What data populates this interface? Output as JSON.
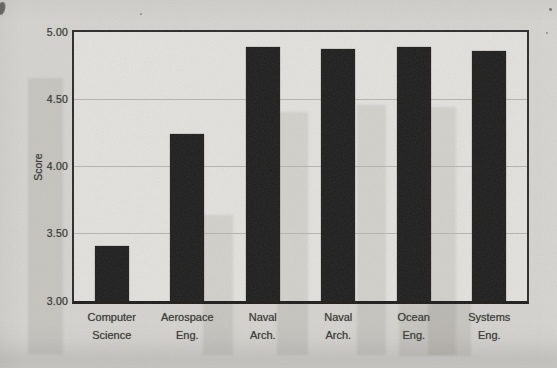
{
  "chart_data": {
    "type": "bar",
    "title": "",
    "xlabel": "",
    "ylabel": "Score",
    "ylim": [
      3.0,
      5.0
    ],
    "ytick_labels": [
      "5.00",
      "4.50",
      "4.00",
      "3.50",
      "3.00"
    ],
    "grid": true,
    "legend": null,
    "categories": [
      "Computer Science",
      "Aerospace Eng.",
      "Naval Arch.",
      "Naval Arch.",
      "Ocean Eng.",
      "Systems Eng."
    ],
    "category_lines": [
      [
        "Computer",
        "Science"
      ],
      [
        "Aerospace",
        "Eng."
      ],
      [
        "Naval",
        "Arch."
      ],
      [
        "Naval",
        "Arch."
      ],
      [
        "Ocean",
        "Eng."
      ],
      [
        "Systems",
        "Eng."
      ]
    ],
    "values": [
      3.41,
      4.24,
      4.89,
      4.87,
      4.89,
      4.86
    ],
    "bar_color": "#1d1d1d"
  },
  "colors": {
    "paper": "#d6d5d1",
    "plot_background": "#e4e3df",
    "bar": "#1d1d1d",
    "frame": "#2b2a28",
    "gridline": "#b7b6b1",
    "text": "#3a3936"
  }
}
